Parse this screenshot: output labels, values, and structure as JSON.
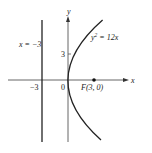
{
  "diagram": {
    "type": "parabola-with-focus-and-directrix",
    "axes": {
      "x_label": "x",
      "y_label": "y",
      "origin_label": "0"
    },
    "curve": {
      "equation_lhs": "y",
      "equation_exp": "2",
      "equation_rhs": " = 12x",
      "equation_full": "y² = 12x"
    },
    "directrix": {
      "label": "x = −3"
    },
    "focus": {
      "label": "F(3, 0)",
      "x": 3,
      "y": 0
    },
    "ticks": {
      "x_neg3": "−3",
      "y_3": "3"
    },
    "colors": {
      "stroke": "#222222",
      "axis": "#555555",
      "background": "#ffffff"
    }
  }
}
